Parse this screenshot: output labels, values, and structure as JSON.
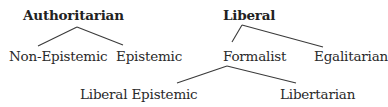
{
  "diagram": {
    "type": "taxonomy-tree",
    "trees": [
      {
        "root": "Authoritarian",
        "children": [
          "Non-Epistemic",
          "Epistemic"
        ]
      },
      {
        "root": "Liberal",
        "children": [
          {
            "label": "Formalist",
            "children": [
              "Liberal Epistemic",
              "Libertarian"
            ]
          },
          "Egalitarian"
        ]
      }
    ]
  },
  "labels": {
    "authoritarian": "Authoritarian",
    "non_epistemic": "Non-Epistemic",
    "epistemic": "Epistemic",
    "liberal": "Liberal",
    "formalist": "Formalist",
    "egalitarian": "Egalitarian",
    "liberal_epistemic": "Liberal Epistemic",
    "libertarian": "Libertarian"
  },
  "colors": {
    "text": "#2a2a2a",
    "line": "#3a3a3a",
    "background": "#ffffff"
  }
}
